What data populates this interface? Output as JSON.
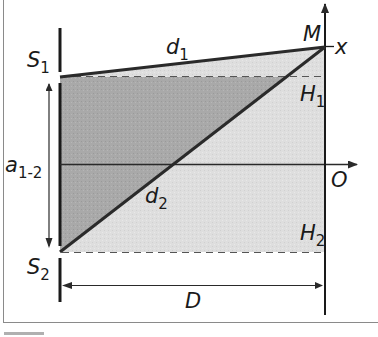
{
  "figure": {
    "type": "double-slit interference geometry",
    "labels": {
      "S1": {
        "main": "S",
        "sub": "1"
      },
      "S2": {
        "main": "S",
        "sub": "2"
      },
      "d1": {
        "main": "d",
        "sub": "1"
      },
      "d2": {
        "main": "d",
        "sub": "2"
      },
      "M": {
        "main": "M"
      },
      "x": {
        "main": "x"
      },
      "H1": {
        "main": "H",
        "sub": "1"
      },
      "H2": {
        "main": "H",
        "sub": "2"
      },
      "O": {
        "main": "O"
      },
      "a12": {
        "main": "a",
        "sub": "1-2"
      },
      "D": {
        "main": "D"
      }
    },
    "colors": {
      "line": "#2a2a2a",
      "dark_fill": "#a9a9a9",
      "light_fill": "#dedede",
      "frame": "#8a8a8a",
      "dashed": "#555555"
    }
  }
}
